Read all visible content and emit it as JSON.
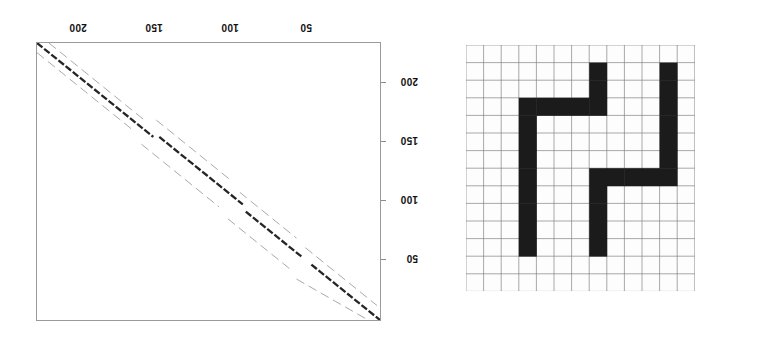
{
  "figure": {
    "kind": "two-panel figure",
    "panels": [
      "dotplot",
      "grid-pattern"
    ]
  },
  "dotplot": {
    "title": "",
    "top_axis": {
      "position": "top",
      "orientation": "reversed",
      "label_rotation_deg": 180,
      "ticks": [
        {
          "label": "200",
          "value": 200,
          "px": 78
        },
        {
          "label": "150",
          "value": 150,
          "px": 154
        },
        {
          "label": "100",
          "value": 100,
          "px": 230
        },
        {
          "label": "50",
          "value": 50,
          "px": 306
        }
      ]
    },
    "right_axis": {
      "position": "right",
      "orientation": "reversed",
      "label_rotation_deg": 180,
      "ticks": [
        {
          "label": "200",
          "value": 200,
          "px": 82
        },
        {
          "label": "150",
          "value": 150,
          "px": 141
        },
        {
          "label": "100",
          "value": 100,
          "px": 200
        },
        {
          "label": "50",
          "value": 50,
          "px": 259
        }
      ]
    },
    "frame_color": "#9a9a9a",
    "main_diagonal_color": "#1a1a1a",
    "offset_diagonal_color": "#8d8d8d"
  },
  "chart_data": {
    "type": "scatter",
    "title": "",
    "xlabel": "",
    "ylabel": "",
    "xlim": [
      230,
      0
    ],
    "ylim": [
      230,
      0
    ],
    "grid": false,
    "legend": null,
    "series": [
      {
        "name": "main diagonal",
        "weight": "heavy",
        "color": "#1a1a1a",
        "segments": [
          {
            "x1": 230,
            "y1": 230,
            "x2": 152,
            "y2": 152
          },
          {
            "x1": 148,
            "y1": 152,
            "x2": 92,
            "y2": 96
          },
          {
            "x1": 90,
            "y1": 90,
            "x2": 52,
            "y2": 52
          },
          {
            "x1": 46,
            "y1": 46,
            "x2": 0,
            "y2": 0
          }
        ]
      },
      {
        "name": "upper off-diagonal",
        "weight": "light",
        "color": "#8d8d8d",
        "offset": 14,
        "segments": [
          {
            "x1": 222,
            "y1": 230,
            "x2": 158,
            "y2": 166
          },
          {
            "x1": 150,
            "y1": 166,
            "x2": 100,
            "y2": 116
          },
          {
            "x1": 94,
            "y1": 106,
            "x2": 56,
            "y2": 68
          },
          {
            "x1": 50,
            "y1": 60,
            "x2": 2,
            "y2": 12
          }
        ]
      },
      {
        "name": "lower off-diagonal",
        "weight": "light",
        "color": "#8d8d8d",
        "offset": -14,
        "segments": [
          {
            "x1": 230,
            "y1": 222,
            "x2": 166,
            "y2": 158
          },
          {
            "x1": 160,
            "y1": 146,
            "x2": 108,
            "y2": 94
          },
          {
            "x1": 102,
            "y1": 84,
            "x2": 60,
            "y2": 42
          },
          {
            "x1": 56,
            "y1": 34,
            "x2": 8,
            "y2": 0
          }
        ]
      }
    ]
  },
  "grid_pattern": {
    "name": "binary occupancy grid",
    "columns": 13,
    "rows": 14,
    "cell_px": 17.6,
    "grid_line_color": "#808080",
    "fill_color": "#1b1b1b",
    "background_color": "#fdfdfd",
    "filled_cells": [
      [
        1,
        7
      ],
      [
        2,
        7
      ],
      [
        3,
        7
      ],
      [
        1,
        11
      ],
      [
        2,
        11
      ],
      [
        3,
        11
      ],
      [
        4,
        11
      ],
      [
        5,
        11
      ],
      [
        6,
        11
      ],
      [
        7,
        11
      ],
      [
        3,
        3
      ],
      [
        3,
        4
      ],
      [
        3,
        5
      ],
      [
        3,
        6
      ],
      [
        4,
        3
      ],
      [
        5,
        3
      ],
      [
        6,
        3
      ],
      [
        7,
        3
      ],
      [
        8,
        3
      ],
      [
        9,
        3
      ],
      [
        10,
        3
      ],
      [
        11,
        3
      ],
      [
        7,
        7
      ],
      [
        7,
        8
      ],
      [
        7,
        9
      ],
      [
        7,
        10
      ],
      [
        8,
        7
      ],
      [
        9,
        7
      ],
      [
        10,
        7
      ],
      [
        11,
        7
      ]
    ],
    "strokes": [
      {
        "id": "upper-middle-vertical",
        "orientation": "vertical",
        "col": 7,
        "row_start": 1,
        "row_end": 3
      },
      {
        "id": "right-vertical",
        "orientation": "vertical",
        "col": 11,
        "row_start": 1,
        "row_end": 7
      },
      {
        "id": "upper-horizontal",
        "orientation": "horizontal",
        "row": 3,
        "col_start": 3,
        "col_end": 7
      },
      {
        "id": "left-vertical",
        "orientation": "vertical",
        "col": 3,
        "row_start": 3,
        "row_end": 11
      },
      {
        "id": "lower-horizontal",
        "orientation": "horizontal",
        "row": 7,
        "col_start": 7,
        "col_end": 11
      },
      {
        "id": "lower-middle-vertical",
        "orientation": "vertical",
        "col": 7,
        "row_start": 7,
        "row_end": 11
      }
    ]
  }
}
